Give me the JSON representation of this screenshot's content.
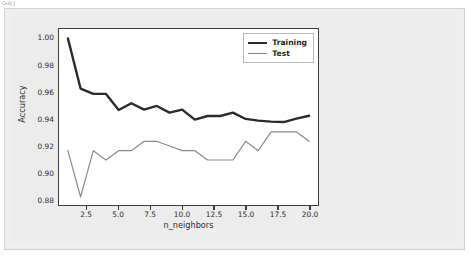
{
  "notebook": {
    "output_stub": "Out[ ]"
  },
  "chart_data": {
    "type": "line",
    "title": "",
    "xlabel": "n_neighbors",
    "ylabel": "Accuracy",
    "xlim": [
      0.3,
      20.7
    ],
    "ylim": [
      0.8755,
      1.007
    ],
    "grid": false,
    "legend_position": "upper right",
    "xticks": [
      "2.5",
      "5.0",
      "7.5",
      "10.0",
      "12.5",
      "15.0",
      "17.5",
      "20.0"
    ],
    "xtick_values": [
      2.5,
      5.0,
      7.5,
      10.0,
      12.5,
      15.0,
      17.5,
      20.0
    ],
    "yticks": [
      "0.88",
      "0.90",
      "0.92",
      "0.94",
      "0.96",
      "0.98",
      "1.00"
    ],
    "ytick_values": [
      0.88,
      0.9,
      0.92,
      0.94,
      0.96,
      0.98,
      1.0
    ],
    "x": [
      1,
      2,
      3,
      4,
      5,
      6,
      7,
      8,
      9,
      10,
      11,
      12,
      13,
      14,
      15,
      16,
      17,
      18,
      19,
      20
    ],
    "series": [
      {
        "name": "Training",
        "color": "#2b2b2b",
        "width": 2.4,
        "values": [
          1.0,
          0.9625,
          0.9585,
          0.9585,
          0.9465,
          0.9515,
          0.9468,
          0.9495,
          0.9445,
          0.9468,
          0.9393,
          0.942,
          0.942,
          0.9445,
          0.9398,
          0.9385,
          0.9378,
          0.9375,
          0.94,
          0.9422
        ]
      },
      {
        "name": "Test",
        "color": "#8a8a8a",
        "width": 1.2,
        "values": [
          0.9161,
          0.8815,
          0.9161,
          0.9091,
          0.9161,
          0.9161,
          0.9231,
          0.9231,
          0.9196,
          0.9161,
          0.9161,
          0.9091,
          0.9091,
          0.9091,
          0.9231,
          0.9161,
          0.9301,
          0.9301,
          0.9301,
          0.9231
        ]
      }
    ]
  }
}
